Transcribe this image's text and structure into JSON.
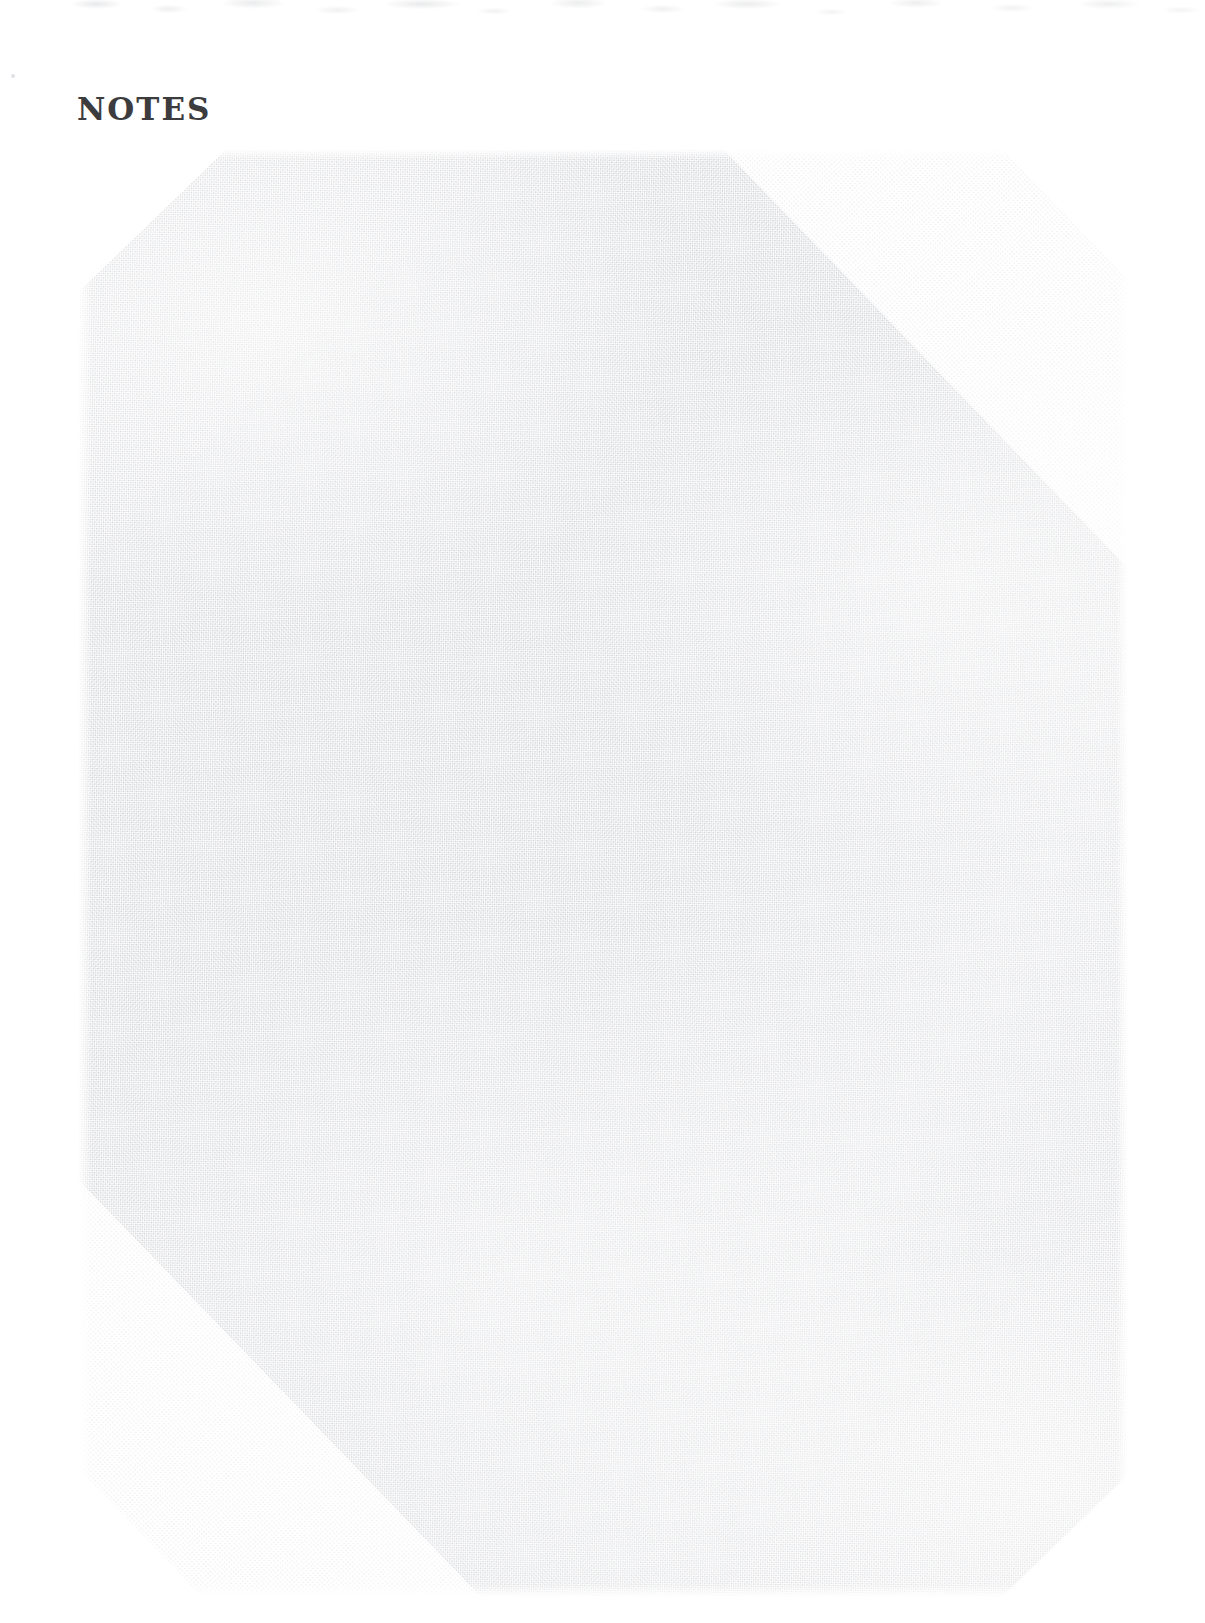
{
  "page": {
    "width": 1205,
    "height": 1623,
    "background_color": "#ffffff",
    "kind": "scanned-notebook-notes-page"
  },
  "heading": {
    "text": "NOTES",
    "color": "#3c3c3e",
    "style": "slab-serif uppercase letterspaced"
  },
  "note_area": {
    "label": "blank lined note writing area",
    "texture": "halftone dot screen",
    "texture_color": "#d6d7da",
    "background_color": "#ffffff",
    "content": "",
    "placeholder": ""
  },
  "artifacts": {
    "top_band_label": "scanner smudge band",
    "margin_speck_label": "stray ink speck"
  }
}
